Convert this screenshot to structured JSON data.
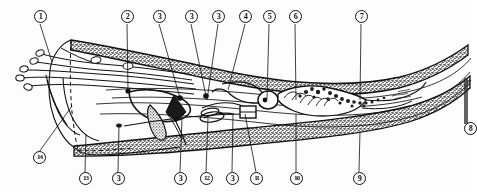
{
  "figure": {
    "kind": "anatomical-line-drawing",
    "background_color": "#fdfdfd",
    "ink_color": "#111111",
    "stipple_color": "#3a3a3a"
  },
  "callouts": {
    "top": [
      {
        "id": "callout-1",
        "text": "1",
        "x": 40,
        "y": 16,
        "leader_to_x": 52,
        "leader_to_y": 62
      },
      {
        "id": "callout-2",
        "text": "2",
        "x": 127,
        "y": 16,
        "leader_to_x": 128,
        "leader_to_y": 90
      },
      {
        "id": "callout-3a",
        "text": "3",
        "x": 159,
        "y": 16,
        "leader_to_x": 180,
        "leader_to_y": 98
      },
      {
        "id": "callout-3b",
        "text": "3",
        "x": 191,
        "y": 16,
        "leader_to_x": 206,
        "leader_to_y": 96
      },
      {
        "id": "callout-3c",
        "text": "3",
        "x": 218,
        "y": 16,
        "leader_to_x": 207,
        "leader_to_y": 100
      },
      {
        "id": "callout-4",
        "text": "4",
        "x": 245,
        "y": 16,
        "leader_to_x": 228,
        "leader_to_y": 90
      },
      {
        "id": "callout-5",
        "text": "5",
        "x": 269,
        "y": 16,
        "leader_to_x": 267,
        "leader_to_y": 99
      },
      {
        "id": "callout-6",
        "text": "6",
        "x": 295,
        "y": 16,
        "leader_to_x": 296,
        "leader_to_y": 100
      },
      {
        "id": "callout-7",
        "text": "7",
        "x": 361,
        "y": 16,
        "leader_to_x": 360,
        "leader_to_y": 100
      }
    ],
    "bottom": [
      {
        "id": "callout-14",
        "text": "14",
        "x": 39,
        "y": 157,
        "leader_to_x": 72,
        "leader_to_y": 106
      },
      {
        "id": "callout-13",
        "text": "13",
        "x": 85,
        "y": 178,
        "leader_to_x": 86,
        "leader_to_y": 134
      },
      {
        "id": "callout-3d",
        "text": "3",
        "x": 118,
        "y": 178,
        "leader_to_x": 119,
        "leader_to_y": 125
      },
      {
        "id": "callout-3e",
        "text": "3",
        "x": 180,
        "y": 178,
        "leader_to_x": 182,
        "leader_to_y": 118
      },
      {
        "id": "callout-12",
        "text": "12",
        "x": 206,
        "y": 178,
        "leader_to_x": 208,
        "leader_to_y": 118
      },
      {
        "id": "callout-3f",
        "text": "3",
        "x": 232,
        "y": 178,
        "leader_to_x": 233,
        "leader_to_y": 114
      },
      {
        "id": "callout-11",
        "text": "11",
        "x": 256,
        "y": 178,
        "leader_to_x": 245,
        "leader_to_y": 114
      },
      {
        "id": "callout-10",
        "text": "10",
        "x": 296,
        "y": 178,
        "leader_to_x": 296,
        "leader_to_y": 114
      },
      {
        "id": "callout-9",
        "text": "9",
        "x": 359,
        "y": 178,
        "leader_to_x": 360,
        "leader_to_y": 131
      }
    ],
    "edge": [
      {
        "id": "callout-edge-partial",
        "text": "8",
        "x": 467,
        "y": 128
      }
    ]
  }
}
